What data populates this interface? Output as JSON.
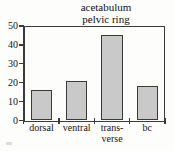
{
  "chart_data": {
    "type": "bar",
    "title": "acetabulum pelvic ring",
    "title_lines": [
      "acetabulum",
      "pelvic ring"
    ],
    "categories": [
      "dorsal",
      "ventral",
      "trans-verse",
      "bc"
    ],
    "category_label_lines": [
      [
        "dorsal"
      ],
      [
        "ventral"
      ],
      [
        "trans-",
        "verse"
      ],
      [
        "bc"
      ]
    ],
    "values": [
      16,
      21,
      45,
      18
    ],
    "xlabel": "",
    "ylabel": "",
    "ylim": [
      0,
      50
    ],
    "yticks": [
      0,
      10,
      20,
      30,
      40,
      50
    ],
    "ytick_labels": [
      "0",
      "10",
      "20",
      "30",
      "40",
      "50"
    ],
    "grid": false,
    "legend": false,
    "bar_fill_color": "#c9c9c9",
    "bar_edge_color": "#3a3a3a",
    "axis_color": "#3b3b3b",
    "background_color": "#fdfdfb"
  }
}
